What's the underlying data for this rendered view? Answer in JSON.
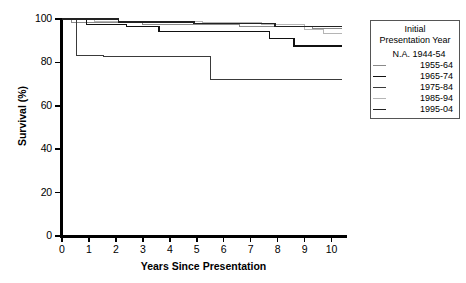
{
  "chart_data": {
    "type": "line",
    "subtype": "kaplan-meier-step",
    "title": "",
    "xlabel": "Years Since Presentation",
    "ylabel": "Survival (%)",
    "xlim": [
      0,
      10.5
    ],
    "ylim": [
      0,
      100
    ],
    "xticks": [
      "0",
      "1",
      "2",
      "3",
      "4",
      "5",
      "6",
      "7",
      "8",
      "9",
      "10"
    ],
    "yticks": [
      "0",
      "20",
      "40",
      "60",
      "80",
      "100"
    ],
    "grid": false,
    "legend_position": "right",
    "legend_title": "Initial Presentation Year",
    "legend_title_line1": "Initial",
    "legend_title_line2": "Presentation Year",
    "series": [
      {
        "name": "N.A. 1944-54",
        "available": false,
        "color": "#000000",
        "width": 1.1,
        "points": []
      },
      {
        "name": "1955-64",
        "available": true,
        "color": "#8a8a8a",
        "width": 1.1,
        "points": [
          [
            0,
            100
          ],
          [
            0.35,
            100
          ],
          [
            0.35,
            98.5
          ],
          [
            3.0,
            98.5
          ],
          [
            3.0,
            97.6
          ],
          [
            6.6,
            97.6
          ],
          [
            6.6,
            96.6
          ],
          [
            9.3,
            96.6
          ],
          [
            9.3,
            95.6
          ],
          [
            10.4,
            95.6
          ]
        ]
      },
      {
        "name": "1965-74",
        "available": true,
        "color": "#111111",
        "width": 1.5,
        "points": [
          [
            0,
            100
          ],
          [
            0.9,
            100
          ],
          [
            0.9,
            97.5
          ],
          [
            2.4,
            97.5
          ],
          [
            2.4,
            96.6
          ],
          [
            3.6,
            96.6
          ],
          [
            3.6,
            94.2
          ],
          [
            7.7,
            94.2
          ],
          [
            7.7,
            91.0
          ],
          [
            8.6,
            91.0
          ],
          [
            8.6,
            87.5
          ],
          [
            10.4,
            87.5
          ]
        ]
      },
      {
        "name": "1975-84",
        "available": true,
        "color": "#3a3a3a",
        "width": 1.2,
        "points": [
          [
            0,
            100
          ],
          [
            0.55,
            100
          ],
          [
            0.55,
            83.2
          ],
          [
            1.55,
            83.2
          ],
          [
            1.55,
            82.8
          ],
          [
            5.5,
            82.8
          ],
          [
            5.5,
            72.0
          ],
          [
            10.4,
            72.0
          ]
        ]
      },
      {
        "name": "1985-94",
        "available": true,
        "color": "#b5b5b5",
        "width": 1.2,
        "points": [
          [
            0,
            100
          ],
          [
            1.2,
            100
          ],
          [
            1.2,
            99.0
          ],
          [
            5.2,
            99.0
          ],
          [
            5.2,
            98.2
          ],
          [
            7.4,
            98.2
          ],
          [
            7.4,
            97.4
          ],
          [
            9.0,
            97.4
          ],
          [
            9.0,
            95.2
          ],
          [
            9.7,
            95.2
          ],
          [
            9.7,
            93.2
          ],
          [
            10.4,
            93.2
          ]
        ]
      },
      {
        "name": "1995-04",
        "available": true,
        "color": "#222222",
        "width": 1.2,
        "points": [
          [
            0,
            100
          ],
          [
            2.1,
            100
          ],
          [
            2.1,
            98.6
          ],
          [
            4.9,
            98.6
          ],
          [
            4.9,
            97.8
          ],
          [
            7.9,
            97.8
          ],
          [
            7.9,
            96.4
          ],
          [
            10.4,
            96.4
          ]
        ]
      }
    ]
  }
}
